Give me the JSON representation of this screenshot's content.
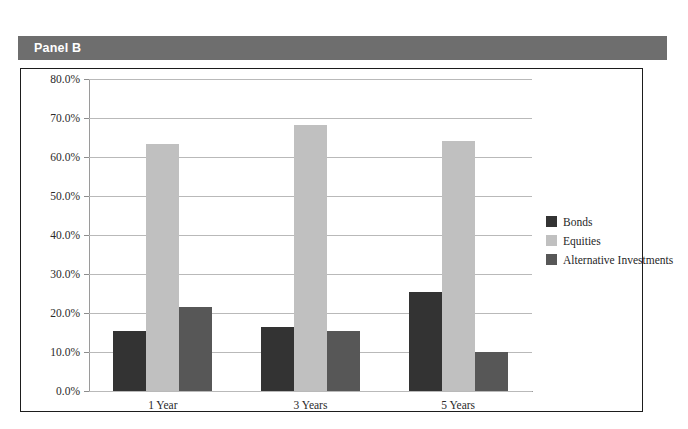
{
  "panel": {
    "title": "Panel B",
    "header_bg": "#6e6e6e",
    "header_text_color": "#ffffff"
  },
  "chart_data": {
    "type": "bar",
    "title": "Panel B",
    "xlabel": "",
    "ylabel": "",
    "ylim": [
      0,
      80
    ],
    "ytick_labels": [
      "0.0%",
      "10.0%",
      "20.0%",
      "30.0%",
      "40.0%",
      "50.0%",
      "60.0%",
      "70.0%",
      "80.0%"
    ],
    "ytick_values": [
      0,
      10,
      20,
      30,
      40,
      50,
      60,
      70,
      80
    ],
    "grid": true,
    "legend_position": "right",
    "categories": [
      "1 Year",
      "3 Years",
      "5 Years"
    ],
    "series": [
      {
        "name": "Bonds",
        "color": "#333333",
        "values": [
          15.5,
          16.4,
          25.5
        ]
      },
      {
        "name": "Equities",
        "color": "#c0c0c0",
        "values": [
          63.3,
          68.3,
          64.0
        ]
      },
      {
        "name": "Alternative Investments",
        "color": "#575757",
        "values": [
          21.5,
          15.5,
          10.1
        ]
      }
    ]
  }
}
